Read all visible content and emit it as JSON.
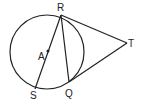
{
  "diagram": {
    "labels": {
      "R": "R",
      "T": "T",
      "A": "A",
      "S": "S",
      "Q": "Q"
    },
    "points": {
      "R": [
        61,
        15
      ],
      "T": [
        127,
        43
      ],
      "A": [
        48,
        51
      ],
      "S": [
        35,
        89
      ],
      "Q": [
        69,
        82
      ]
    },
    "circle": {
      "cx": 47,
      "cy": 52,
      "r": 37
    },
    "stroke_color": "#222222"
  }
}
